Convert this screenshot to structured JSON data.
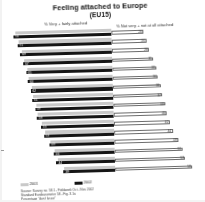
{
  "chart": {
    "title": "Feeling attached to Europe",
    "subtitle": "(EU15)",
    "left_axis_label": "% Very + fairly attached",
    "right_axis_label": "% Not very + not at all attached",
    "legend": [
      {
        "label": "2001",
        "color": "#c9c9c9"
      },
      {
        "label": "2002",
        "color": "#151515"
      }
    ],
    "source_lines": [
      "Source: Survey no. 58.1 - Fieldwork Oct - Nov 2002",
      "Standard Eurobarometer 58 - Fig. 3.1a",
      "Percentage \"don't know\""
    ]
  },
  "chart_data": {
    "type": "bar",
    "title": "Feeling attached to Europe (EU15)",
    "xlabel": "",
    "ylabel": "",
    "orientation": "horizontal",
    "layout": "diverging",
    "grid": false,
    "legend_position": "bottom-left",
    "xlim": [
      0,
      100
    ],
    "categories": [
      "LUX",
      "ITA",
      "ESP",
      "BEL",
      "AUT",
      "IRL",
      "FRA",
      "DEU",
      "PRT",
      "EU15",
      "DNK",
      "NLD",
      "SWE",
      "FIN",
      "GRC",
      "GBR"
    ],
    "series": [
      {
        "name": "2001",
        "measure": "% Very + fairly attached",
        "color": "#c9c9c9",
        "values": [
          72,
          70,
          68,
          66,
          64,
          63,
          61,
          60,
          58,
          57,
          54,
          52,
          48,
          45,
          43,
          38
        ]
      },
      {
        "name": "2002",
        "measure": "% Very + fairly attached",
        "color": "#151515",
        "values": [
          74,
          71,
          69,
          67,
          65,
          64,
          62,
          61,
          59,
          58,
          55,
          53,
          49,
          46,
          44,
          39
        ]
      },
      {
        "name": "2002 negative",
        "measure": "% Not very + not at all attached",
        "color": "#ffffff",
        "values": [
          24,
          26,
          28,
          31,
          33,
          34,
          36,
          37,
          39,
          40,
          42,
          44,
          48,
          51,
          53,
          58
        ]
      }
    ]
  }
}
